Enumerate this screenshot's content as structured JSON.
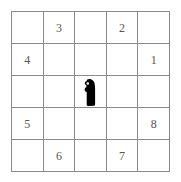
{
  "puzzle": {
    "title": "5x5 number grid",
    "rows": 5,
    "columns": 5,
    "grid_line_color": "#8a8a8a",
    "number_color": "#555555",
    "background_color": "#ffffff",
    "marker_color": "#000000",
    "cells": [
      [
        {
          "value": "",
          "row": 1,
          "col": 1
        },
        {
          "value": "3",
          "row": 1,
          "col": 2
        },
        {
          "value": "",
          "row": 1,
          "col": 3
        },
        {
          "value": "2",
          "row": 1,
          "col": 4
        },
        {
          "value": "",
          "row": 1,
          "col": 5
        }
      ],
      [
        {
          "value": "4",
          "row": 2,
          "col": 1
        },
        {
          "value": "",
          "row": 2,
          "col": 2
        },
        {
          "value": "",
          "row": 2,
          "col": 3
        },
        {
          "value": "",
          "row": 2,
          "col": 4
        },
        {
          "value": "1",
          "row": 2,
          "col": 5
        }
      ],
      [
        {
          "value": "",
          "row": 3,
          "col": 1
        },
        {
          "value": "",
          "row": 3,
          "col": 2
        },
        {
          "value": "",
          "row": 3,
          "col": 3,
          "marker": "black-blob-marker"
        },
        {
          "value": "",
          "row": 3,
          "col": 4
        },
        {
          "value": "",
          "row": 3,
          "col": 5
        }
      ],
      [
        {
          "value": "5",
          "row": 4,
          "col": 1
        },
        {
          "value": "",
          "row": 4,
          "col": 2
        },
        {
          "value": "",
          "row": 4,
          "col": 3
        },
        {
          "value": "",
          "row": 4,
          "col": 4
        },
        {
          "value": "8",
          "row": 4,
          "col": 5
        }
      ],
      [
        {
          "value": "",
          "row": 5,
          "col": 1
        },
        {
          "value": "6",
          "row": 5,
          "col": 2
        },
        {
          "value": "",
          "row": 5,
          "col": 3
        },
        {
          "value": "7",
          "row": 5,
          "col": 4
        },
        {
          "value": "",
          "row": 5,
          "col": 5
        }
      ]
    ],
    "marker": {
      "name": "black-blob-marker",
      "cell_row": 3,
      "cell_col": 3,
      "color": "#000000"
    }
  }
}
